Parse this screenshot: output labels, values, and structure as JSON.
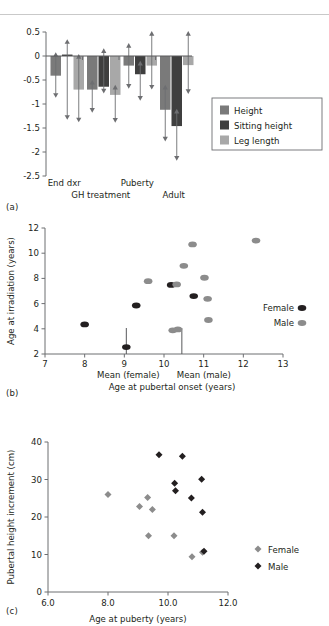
{
  "figure": {
    "panel_tags": {
      "a": "(a)",
      "b": "(b)",
      "c": "(c)"
    },
    "colors": {
      "height": "#7a7a7a",
      "sitting_height": "#3f3f3f",
      "leg_length": "#a8a8a8",
      "female_b": "#231f20",
      "male_b": "#8c8c8c",
      "female_c": "#8c8c8c",
      "male_c": "#231f20",
      "axis": "#6d6e71",
      "rule": "#c9c9c9"
    }
  },
  "chart_data": [
    {
      "id": "panel-a",
      "type": "bar",
      "title": "",
      "xlabel": "",
      "ylabel": "",
      "ylim": [
        -2.5,
        0.5
      ],
      "yticks": [
        0.5,
        0,
        -0.5,
        -1,
        -1.5,
        -2,
        -2.5
      ],
      "ytick_labels": [
        "0.5",
        "0",
        "-0.5",
        "-1",
        "-1.5",
        "-2",
        "-2.5"
      ],
      "grid": false,
      "categories": [
        "End dxr",
        "GH treatment",
        "Puberty",
        "Adult"
      ],
      "series": [
        {
          "name": "Height",
          "color": "#7a7a7a",
          "values": [
            -0.41,
            -0.7,
            -0.2,
            -1.12
          ],
          "err_low": [
            -0.87,
            -1.18,
            -0.68,
            -1.78
          ],
          "err_high": [
            0.08,
            -0.5,
            0.27,
            -0.6
          ]
        },
        {
          "name": "Sitting height",
          "color": "#3f3f3f",
          "values": [
            0.03,
            -0.64,
            -0.38,
            -1.46
          ],
          "err_low": [
            -1.33,
            -0.78,
            -0.93,
            -2.18
          ],
          "err_high": [
            0.35,
            0.16,
            -0.1,
            -1.1
          ]
        },
        {
          "name": "Leg length",
          "color": "#a8a8a8",
          "values": [
            -0.7,
            -0.81,
            -0.2,
            -0.19
          ],
          "err_low": [
            -1.38,
            -1.39,
            -0.7,
            -0.79
          ],
          "err_high": [
            0.04,
            -0.6,
            0.52,
            0.52
          ]
        }
      ],
      "legend": {
        "position": "right",
        "entries": [
          "Height",
          "Sitting height",
          "Leg length"
        ]
      }
    },
    {
      "id": "panel-b",
      "type": "scatter",
      "title": "",
      "xlabel": "Age at pubertal onset (years)",
      "ylabel": "Age at irradiation (years)",
      "xlim": [
        7,
        13
      ],
      "ylim": [
        2,
        12
      ],
      "xticks": [
        7,
        8,
        9,
        10,
        11,
        12,
        13
      ],
      "yticks": [
        2,
        4,
        6,
        8,
        10,
        12
      ],
      "grid": false,
      "annotations": [
        {
          "label": "Mean (female)",
          "x": 9.05,
          "type": "mean-line"
        },
        {
          "label": "Mean (male)",
          "x": 10.45,
          "type": "mean-line"
        }
      ],
      "series": [
        {
          "name": "Female",
          "color": "#231f20",
          "points": [
            [
              8.0,
              4.35
            ],
            [
              9.05,
              2.55
            ],
            [
              9.3,
              5.85
            ],
            [
              10.18,
              7.48
            ],
            [
              10.75,
              6.6
            ]
          ]
        },
        {
          "name": "Male",
          "color": "#8c8c8c",
          "points": [
            [
              9.6,
              7.78
            ],
            [
              10.22,
              3.88
            ],
            [
              10.35,
              3.95
            ],
            [
              10.32,
              7.52
            ],
            [
              10.5,
              9.0
            ],
            [
              10.72,
              10.7
            ],
            [
              11.02,
              8.05
            ],
            [
              11.1,
              6.38
            ],
            [
              11.12,
              4.7
            ],
            [
              12.32,
              11.0
            ]
          ]
        }
      ],
      "legend": {
        "position": "right",
        "entries": [
          "Female",
          "Male"
        ]
      }
    },
    {
      "id": "panel-c",
      "type": "scatter",
      "title": "",
      "xlabel": "Age at puberty (years)",
      "ylabel": "Pubertal height increment (cm)",
      "xlim": [
        6.0,
        12.0
      ],
      "ylim": [
        0,
        40
      ],
      "xticks": [
        6.0,
        8.0,
        10.0,
        12.0
      ],
      "xtick_labels": [
        "6.0",
        "8.0",
        "10.0",
        "12.0"
      ],
      "yticks": [
        0,
        10,
        20,
        30,
        40
      ],
      "grid": false,
      "series": [
        {
          "name": "Female",
          "color": "#8c8c8c",
          "points": [
            [
              8.0,
              26.0
            ],
            [
              9.05,
              22.8
            ],
            [
              9.32,
              25.2
            ],
            [
              9.35,
              15.0
            ],
            [
              9.48,
              22.0
            ],
            [
              10.2,
              15.0
            ],
            [
              10.8,
              9.4
            ],
            [
              11.15,
              10.6
            ]
          ]
        },
        {
          "name": "Male",
          "color": "#231f20",
          "points": [
            [
              9.7,
              36.6
            ],
            [
              10.22,
              29.0
            ],
            [
              10.25,
              27.0
            ],
            [
              10.48,
              36.2
            ],
            [
              10.78,
              25.1
            ],
            [
              11.12,
              30.1
            ],
            [
              11.15,
              21.3
            ],
            [
              11.2,
              10.9
            ]
          ]
        }
      ],
      "legend": {
        "position": "right",
        "entries": [
          "Female",
          "Male"
        ]
      }
    }
  ]
}
